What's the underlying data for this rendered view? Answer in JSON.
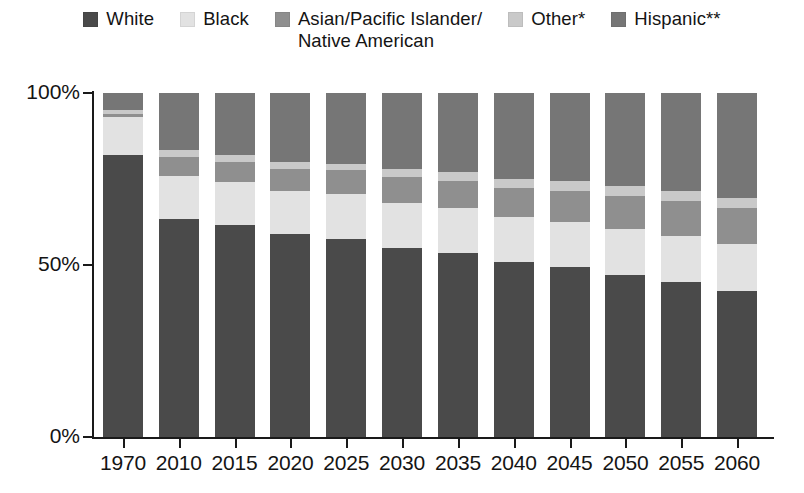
{
  "legend": {
    "items": [
      {
        "label": "White",
        "color": "#4a4a4a",
        "key": "white"
      },
      {
        "label": "Black",
        "color": "#e2e2e2",
        "key": "black"
      },
      {
        "label": "Asian/Pacific Islander/\nNative American",
        "color": "#8f8f8f",
        "key": "asian"
      },
      {
        "label": "Other*",
        "color": "#c9c9c9",
        "key": "other"
      },
      {
        "label": "Hispanic**",
        "color": "#767676",
        "key": "hispanic"
      }
    ]
  },
  "axis": {
    "y_ticks": [
      "100%",
      "50%",
      "0%"
    ],
    "y_values": [
      100,
      50,
      0
    ]
  },
  "chart_data": {
    "type": "bar",
    "stacked": true,
    "title": "",
    "xlabel": "",
    "ylabel": "",
    "ylim": [
      0,
      100
    ],
    "grid": false,
    "legend_position": "top",
    "categories": [
      "1970",
      "2010",
      "2015",
      "2020",
      "2025",
      "2030",
      "2035",
      "2040",
      "2045",
      "2050",
      "2055",
      "2060"
    ],
    "series": [
      {
        "name": "White",
        "color": "#4a4a4a",
        "values": [
          82,
          63.5,
          61.5,
          59,
          57.5,
          55,
          53.5,
          51,
          49.5,
          47,
          45,
          42.5
        ]
      },
      {
        "name": "Black",
        "color": "#e2e2e2",
        "values": [
          11,
          12.5,
          12.5,
          12.5,
          13,
          13,
          13,
          13,
          13,
          13.5,
          13.5,
          13.5
        ]
      },
      {
        "name": "Asian/Pacific Islander/Native American",
        "color": "#8f8f8f",
        "values": [
          1,
          5.5,
          6,
          6.5,
          7,
          7.5,
          8,
          8.5,
          9,
          9.5,
          10,
          10.5
        ]
      },
      {
        "name": "Other*",
        "color": "#c9c9c9",
        "values": [
          1,
          2,
          2,
          2,
          2,
          2.5,
          2.5,
          2.5,
          3,
          3,
          3,
          3
        ]
      },
      {
        "name": "Hispanic**",
        "color": "#767676",
        "values": [
          5,
          16.5,
          18,
          20,
          20.5,
          22,
          23,
          25,
          25.5,
          27,
          28.5,
          30.5
        ]
      }
    ]
  }
}
